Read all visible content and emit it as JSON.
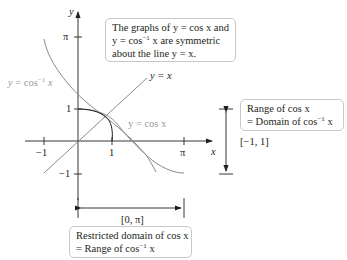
{
  "diagram": {
    "axes": {
      "x_label": "x",
      "y_label": "y",
      "x_ticks": [
        "−1",
        "1",
        "π"
      ],
      "y_ticks": [
        "π",
        "1",
        "−1"
      ]
    },
    "curve_labels": {
      "arccos": "y = cos",
      "arccos_sup": "−1",
      "arccos_var": "x",
      "identity": "y = x",
      "cos": "y = cos x"
    },
    "callouts": {
      "symmetry": {
        "line1": "The graphs of y = cos x and",
        "line2_a": "y = cos",
        "line2_sup": "−1",
        "line2_b": " x are symmetric",
        "line3": "about the line y = x."
      },
      "range": {
        "line1": "Range of cos x",
        "line2_a": "= Domain of cos",
        "line2_sup": "−1",
        "line2_b": " x"
      },
      "domain": {
        "line1": "Restricted domain of cos x",
        "line2_a": "= Range of cos",
        "line2_sup": "−1",
        "line2_b": " x"
      }
    },
    "intervals": {
      "range_interval": "[−1, 1]",
      "domain_interval": "[0, π]"
    },
    "colors": {
      "axis": "#231f20",
      "curve": "#8a8a8a",
      "label_gray": "#9a9a9a",
      "box_border": "#c8c8c8"
    }
  }
}
